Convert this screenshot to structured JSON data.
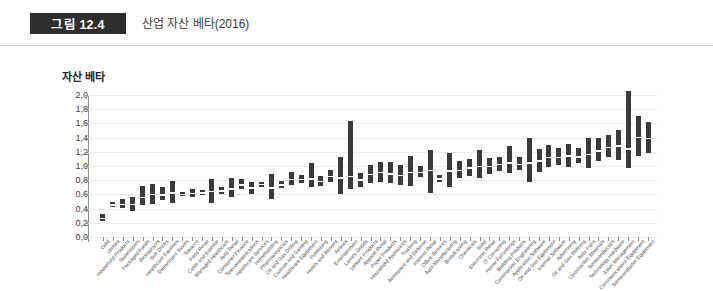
{
  "figure": {
    "badge_label": "그림 12.4",
    "caption": "산업 자산 베타(2016)"
  },
  "chart_data": {
    "type": "bar",
    "subtype": "floating-range-bar",
    "title": "산업 자산 베타(2016)",
    "xlabel": "",
    "ylabel": "자산 베타",
    "ylim": [
      0.0,
      2.0
    ],
    "ytick_labels": [
      "0,0",
      "0,2",
      "0,4",
      "0,6",
      "0,8",
      "1,0",
      "1,2",
      "1,4",
      "1,6",
      "1,8",
      "2,0"
    ],
    "ytick_values": [
      0.0,
      0.2,
      0.4,
      0.6,
      0.8,
      1.0,
      1.2,
      1.4,
      1.6,
      1.8,
      2.0
    ],
    "grid": true,
    "legend": "none",
    "bar_color": "#3a3a3a",
    "median_color": "#ffffff",
    "categories": [
      "Gold",
      "Utilities",
      "Household Products",
      "Superstores",
      "Packaged Foods",
      "Restaurants",
      "Soft Drinks",
      "Healthcare Facilities",
      "Department Stores",
      "Tobacco",
      "Food Retail",
      "Cable and Satellite",
      "Managed Healthcare",
      "Auto Retail",
      "Consumer Finance",
      "Telecommunications",
      "Healthcare Services",
      "Homebuilding",
      "Pharmaceuticals",
      "Oil and Gas Drilling",
      "Casinos and Gaming",
      "Healthcare Equipment",
      "Publishing",
      "Hotels and Resorts",
      "Airlines",
      "Entertainment",
      "Luxury Goods",
      "Leisure Products",
      "Apparel Retail",
      "Paper Products",
      "Household Appliances",
      "Trucking",
      "Aerospace and Defense",
      "Internet Retail",
      "Office Services",
      "Auto Manufacturing",
      "Broadcasting",
      "Chemicals",
      "Steel",
      "Electronic Retail",
      "IT Consulting",
      "Home Furnishings",
      "Building Products",
      "Construction Engineering",
      "Application Software",
      "Oil and Gas Equipment",
      "Internet Software",
      "Advertising",
      "Oil and Gas Refining",
      "Auto Parts",
      "Construction Materials",
      "Semiconductors",
      "Technology Hardware",
      "Asset Management",
      "Communications Equipment",
      "Semiconductor Equipment"
    ],
    "series": [
      {
        "name": "자산 베타 범위",
        "low": [
          0.22,
          0.42,
          0.41,
          0.37,
          0.45,
          0.47,
          0.52,
          0.48,
          0.58,
          0.56,
          0.59,
          0.48,
          0.6,
          0.56,
          0.68,
          0.61,
          0.71,
          0.54,
          0.69,
          0.73,
          0.76,
          0.7,
          0.72,
          0.78,
          0.6,
          0.67,
          0.71,
          0.76,
          0.78,
          0.76,
          0.73,
          0.72,
          0.84,
          0.62,
          0.78,
          0.71,
          0.83,
          0.86,
          0.83,
          0.89,
          0.93,
          0.9,
          0.94,
          0.77,
          0.92,
          0.98,
          1.01,
          0.99,
          1.04,
          0.97,
          1.07,
          1.12,
          1.09,
          0.97,
          1.14,
          1.18
        ],
        "high": [
          0.32,
          0.5,
          0.53,
          0.56,
          0.72,
          0.75,
          0.7,
          0.79,
          0.63,
          0.68,
          0.66,
          0.81,
          0.71,
          0.83,
          0.82,
          0.78,
          0.78,
          0.89,
          0.79,
          0.92,
          0.88,
          1.04,
          0.86,
          0.94,
          1.13,
          1.63,
          0.9,
          1.02,
          1.05,
          1.06,
          1.02,
          1.14,
          1.0,
          1.23,
          0.88,
          1.18,
          1.07,
          1.1,
          1.22,
          1.11,
          1.13,
          1.28,
          1.12,
          1.4,
          1.24,
          1.3,
          1.25,
          1.31,
          1.25,
          1.4,
          1.39,
          1.44,
          1.51,
          2.05,
          1.7,
          1.62
        ],
        "median": [
          0.27,
          0.46,
          0.47,
          0.47,
          0.57,
          0.61,
          0.6,
          0.63,
          0.61,
          0.62,
          0.63,
          0.65,
          0.66,
          0.69,
          0.74,
          0.7,
          0.75,
          0.7,
          0.74,
          0.82,
          0.82,
          0.83,
          0.79,
          0.86,
          0.84,
          0.86,
          0.81,
          0.89,
          0.92,
          0.9,
          0.88,
          0.92,
          0.92,
          0.95,
          0.83,
          0.94,
          0.95,
          0.98,
          1.0,
          1.0,
          1.03,
          1.05,
          1.03,
          1.05,
          1.08,
          1.13,
          1.13,
          1.15,
          1.14,
          1.17,
          1.22,
          1.27,
          1.29,
          1.25,
          1.41,
          1.4
        ]
      }
    ]
  }
}
